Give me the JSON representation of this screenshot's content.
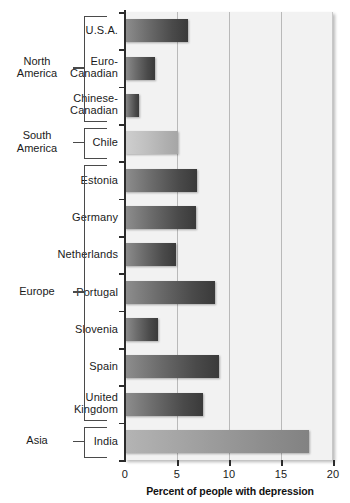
{
  "chart_data": {
    "type": "bar",
    "orientation": "horizontal",
    "title": "",
    "xlabel": "Percent of people with depression",
    "ylabel": "",
    "xlim": [
      0,
      20
    ],
    "xticks": [
      0,
      5,
      10,
      15,
      20
    ],
    "xtick_labels": [
      "0",
      "5",
      "10",
      "15",
      "20"
    ],
    "grid": "vertical",
    "legend": "none",
    "categories": [
      "U.S.A.",
      "Euro-Canadian",
      "Chinese-Canadian",
      "Chile",
      "Estonia",
      "Germany",
      "Netherlands",
      "Portugal",
      "Slovenia",
      "Spain",
      "United Kingdom",
      "India"
    ],
    "values": [
      6.1,
      2.9,
      1.3,
      5.1,
      6.9,
      6.8,
      4.9,
      8.7,
      3.2,
      9.0,
      7.5,
      17.7
    ],
    "groups": [
      {
        "name": "North America",
        "categories": [
          "U.S.A.",
          "Euro-Canadian",
          "Chinese-Canadian"
        ]
      },
      {
        "name": "South America",
        "categories": [
          "Chile"
        ]
      },
      {
        "name": "Europe",
        "categories": [
          "Estonia",
          "Germany",
          "Netherlands",
          "Portugal",
          "Slovenia",
          "Spain",
          "United Kingdom"
        ]
      },
      {
        "name": "Asia",
        "categories": [
          "India"
        ]
      }
    ]
  },
  "bars": [
    {
      "label": "U.S.A.",
      "label_line1": "U.S.A.",
      "label_line2": "",
      "value": 6.1,
      "shade": "dark"
    },
    {
      "label": "Euro-Canadian",
      "label_line1": "Euro-",
      "label_line2": "Canadian",
      "value": 2.9,
      "shade": "dark"
    },
    {
      "label": "Chinese-Canadian",
      "label_line1": "Chinese-",
      "label_line2": "Canadian",
      "value": 1.3,
      "shade": "dark"
    },
    {
      "label": "Chile",
      "label_line1": "Chile",
      "label_line2": "",
      "value": 5.1,
      "shade": "light"
    },
    {
      "label": "Estonia",
      "label_line1": "Estonia",
      "label_line2": "",
      "value": 6.9,
      "shade": "dark"
    },
    {
      "label": "Germany",
      "label_line1": "Germany",
      "label_line2": "",
      "value": 6.8,
      "shade": "dark"
    },
    {
      "label": "Netherlands",
      "label_line1": "Netherlands",
      "label_line2": "",
      "value": 4.9,
      "shade": "dark"
    },
    {
      "label": "Portugal",
      "label_line1": "Portugal",
      "label_line2": "",
      "value": 8.7,
      "shade": "dark"
    },
    {
      "label": "Slovenia",
      "label_line1": "Slovenia",
      "label_line2": "",
      "value": 3.2,
      "shade": "dark"
    },
    {
      "label": "Spain",
      "label_line1": "Spain",
      "label_line2": "",
      "value": 9.0,
      "shade": "dark"
    },
    {
      "label": "United Kingdom",
      "label_line1": "United",
      "label_line2": "Kingdom",
      "value": 7.5,
      "shade": "dark"
    },
    {
      "label": "India",
      "label_line1": "India",
      "label_line2": "",
      "value": 17.7,
      "shade": "mid"
    }
  ],
  "regions": [
    {
      "name": "North America",
      "line1": "North",
      "line2": "America",
      "first": 0,
      "last": 2
    },
    {
      "name": "South America",
      "line1": "South",
      "line2": "America",
      "first": 3,
      "last": 3
    },
    {
      "name": "Europe",
      "line1": "Europe",
      "line2": "",
      "first": 4,
      "last": 10
    },
    {
      "name": "Asia",
      "line1": "Asia",
      "line2": "",
      "first": 11,
      "last": 11
    }
  ],
  "axis": {
    "title": "Percent of people with depression",
    "ticks": [
      "0",
      "5",
      "10",
      "15",
      "20"
    ]
  },
  "colors": {
    "plot_background": "#f2f2f2",
    "gridline": "#b9b9b9",
    "axis": "#2b2b2b",
    "bar_dark_start": "#8e8e8e",
    "bar_dark_end": "#3a3a3a",
    "bar_light_start": "#cfcfcf",
    "bar_light_end": "#a6a6a6",
    "text": "#1a1a1a"
  }
}
